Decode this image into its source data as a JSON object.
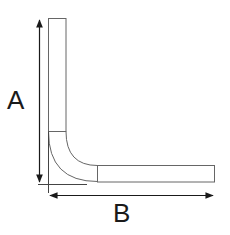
{
  "diagram": {
    "labels": {
      "vertical_dimension": "A",
      "horizontal_dimension": "B"
    },
    "colors": {
      "stroke": "#1a1a1a",
      "outline": "#666666",
      "background": "#ffffff"
    },
    "parts": [
      {
        "name": "vertical-leg",
        "type": "straight"
      },
      {
        "name": "elbow-bend",
        "type": "curved"
      },
      {
        "name": "horizontal-leg",
        "type": "straight"
      }
    ],
    "dimensions": [
      {
        "name": "A",
        "axis": "vertical",
        "direction": "double-arrow"
      },
      {
        "name": "B",
        "axis": "horizontal",
        "direction": "double-arrow"
      }
    ]
  }
}
